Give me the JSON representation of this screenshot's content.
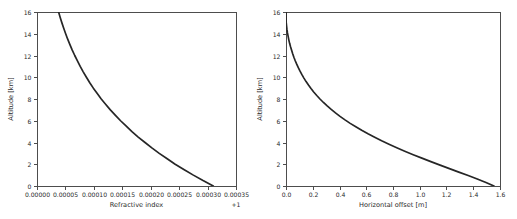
{
  "figure": {
    "background": "#ffffff",
    "curve_color": "#262626",
    "grid_color": "#e8e8e8",
    "frame_color": "#4d4d4d"
  },
  "chart_data": [
    {
      "type": "line",
      "title": "",
      "xlabel": "Refractive index",
      "ylabel": "Altitude [km]",
      "x_offset_label": "+1",
      "xlim": [
        0.0,
        0.00035
      ],
      "ylim": [
        0,
        16
      ],
      "grid": true,
      "legend": "none",
      "xticks": [
        0.0,
        5e-05,
        0.0001,
        0.00015,
        0.0002,
        0.00025,
        0.0003,
        0.00035
      ],
      "xticklabels": [
        "0.00000",
        "0.00005",
        "0.00010",
        "0.00015",
        "0.00020",
        "0.00025",
        "0.00030",
        "0.00035"
      ],
      "yticks": [
        0,
        2,
        4,
        6,
        8,
        10,
        12,
        14,
        16
      ],
      "yticklabels": [
        "0",
        "2",
        "4",
        "6",
        "8",
        "10",
        "12",
        "14",
        "16"
      ],
      "x": [
        0.00031,
        0.000292,
        0.000275,
        0.000259,
        0.000243,
        0.000229,
        0.000215,
        0.000202,
        0.00019,
        0.000178,
        0.000167,
        0.000157,
        0.000147,
        0.000138,
        0.000129,
        0.000121,
        0.000113,
        0.000106,
        9.91e-05,
        9.28e-05,
        8.69e-05,
        8.13e-05,
        7.6e-05,
        7.11e-05,
        6.64e-05,
        6.2e-05,
        5.79e-05,
        5.4e-05,
        5.04e-05,
        4.7e-05,
        4.38e-05,
        4.08e-05,
        3.8e-05,
        3.54e-05
      ],
      "y": [
        0.0,
        0.5,
        1.0,
        1.5,
        2.0,
        2.5,
        3.0,
        3.5,
        4.0,
        4.5,
        5.0,
        5.5,
        6.0,
        6.5,
        7.0,
        7.5,
        8.0,
        8.5,
        9.0,
        9.5,
        10.0,
        10.5,
        11.0,
        11.5,
        12.0,
        12.5,
        13.0,
        13.5,
        14.0,
        14.5,
        15.0,
        15.5,
        16.0,
        16.4
      ]
    },
    {
      "type": "line",
      "title": "",
      "xlabel": "Horizontal offset [m]",
      "ylabel": "Altitude [km]",
      "xlim": [
        0.0,
        1.6
      ],
      "ylim": [
        0,
        16
      ],
      "grid": true,
      "legend": "none",
      "xticks": [
        0.0,
        0.2,
        0.4,
        0.6,
        0.8,
        1.0,
        1.2,
        1.4,
        1.6
      ],
      "xticklabels": [
        "0.0",
        "0.2",
        "0.4",
        "0.6",
        "0.8",
        "1.0",
        "1.2",
        "1.4",
        "1.6"
      ],
      "yticks": [
        0,
        2,
        4,
        6,
        8,
        10,
        12,
        14,
        16
      ],
      "yticklabels": [
        "0",
        "2",
        "4",
        "6",
        "8",
        "10",
        "12",
        "14",
        "16"
      ],
      "x": [
        1.555,
        1.495,
        1.43,
        1.362,
        1.292,
        1.222,
        1.152,
        1.083,
        1.016,
        0.951,
        0.888,
        0.828,
        0.77,
        0.715,
        0.663,
        0.613,
        0.566,
        0.522,
        0.48,
        0.441,
        0.404,
        0.37,
        0.338,
        0.308,
        0.28,
        0.254,
        0.23,
        0.207,
        0.187,
        0.168,
        0.15,
        0.134,
        0.119,
        0.105,
        0.092,
        0.08,
        0.069,
        0.059,
        0.05,
        0.042,
        0.034,
        0.027,
        0.021,
        0.016,
        0.011,
        0.007,
        0.004,
        0.0018,
        0.0006,
        0.0001,
        0.0
      ],
      "y": [
        0.0,
        0.32,
        0.64,
        0.96,
        1.28,
        1.6,
        1.92,
        2.24,
        2.56,
        2.88,
        3.2,
        3.52,
        3.84,
        4.16,
        4.48,
        4.8,
        5.12,
        5.44,
        5.76,
        6.08,
        6.4,
        6.72,
        7.04,
        7.36,
        7.68,
        8.0,
        8.32,
        8.64,
        8.96,
        9.28,
        9.6,
        9.92,
        10.24,
        10.56,
        10.88,
        11.2,
        11.52,
        11.84,
        12.16,
        12.48,
        12.8,
        13.12,
        13.44,
        13.76,
        14.08,
        14.4,
        14.72,
        15.0,
        15.3,
        15.6,
        16.0
      ]
    }
  ]
}
